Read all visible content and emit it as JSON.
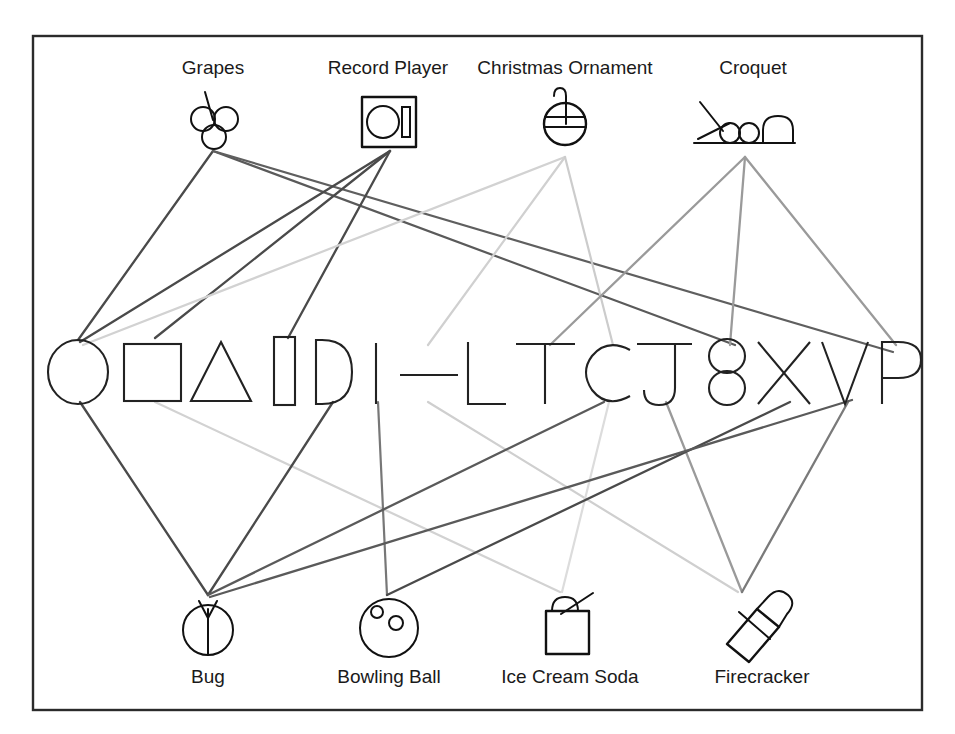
{
  "figure": {
    "title": "",
    "frame": {
      "x": 33,
      "y": 36,
      "width": 889,
      "height": 674,
      "color": "#2b2b2b"
    }
  },
  "colors": {
    "ink": "#1a1a1a",
    "edge_dark": "#4a4a4a",
    "edge_mid": "#8a8a8a",
    "edge_light": "#cfcfcf",
    "background": "#ffffff"
  },
  "top_nodes": [
    {
      "id": "grapes",
      "label": "Grapes",
      "label_x": 213,
      "label_y": 74,
      "icon": "grapes-icon",
      "icon_cx": 213,
      "icon_cy": 120,
      "anchor_x": 213,
      "anchor_y": 151
    },
    {
      "id": "record_player",
      "label": "Record Player",
      "label_x": 388,
      "label_y": 74,
      "icon": "record-player-icon",
      "icon_cx": 388,
      "icon_cy": 122,
      "anchor_x": 390,
      "anchor_y": 151
    },
    {
      "id": "christmas_ornament",
      "label": "Christmas Ornament",
      "label_x": 565,
      "label_y": 74,
      "icon": "christmas-ornament-icon",
      "icon_cx": 563,
      "icon_cy": 120,
      "anchor_x": 565,
      "anchor_y": 157
    },
    {
      "id": "croquet",
      "label": "Croquet",
      "label_x": 753,
      "label_y": 74,
      "icon": "croquet-icon",
      "icon_cx": 748,
      "icon_cy": 122,
      "anchor_x": 745,
      "anchor_y": 157
    }
  ],
  "bottom_nodes": [
    {
      "id": "bug",
      "label": "Bug",
      "label_x": 208,
      "label_y": 683,
      "icon": "bug-icon",
      "icon_cx": 208,
      "icon_cy": 629,
      "anchor_x": 208,
      "anchor_y": 595
    },
    {
      "id": "bowling_ball",
      "label": "Bowling Ball",
      "label_x": 389,
      "label_y": 683,
      "icon": "bowling-ball-icon",
      "icon_cx": 387,
      "icon_cy": 629,
      "anchor_x": 387,
      "anchor_y": 595
    },
    {
      "id": "ice_cream_soda",
      "label": "Ice Cream Soda",
      "label_x": 570,
      "label_y": 683,
      "icon": "ice-cream-soda-icon",
      "icon_cx": 563,
      "icon_cy": 629,
      "anchor_x": 560,
      "anchor_y": 592
    },
    {
      "id": "firecracker",
      "label": "Firecracker",
      "label_x": 762,
      "label_y": 683,
      "icon": "firecracker-icon",
      "icon_cx": 748,
      "icon_cy": 629,
      "anchor_x": 740,
      "anchor_y": 592
    }
  ],
  "middle_row": {
    "baseline_y": 375,
    "items": [
      {
        "id": "m0",
        "glyph": "circle",
        "name": "circle-shape",
        "cx": 78,
        "cy": 372
      },
      {
        "id": "m1",
        "glyph": "square",
        "name": "square-shape",
        "cx": 152,
        "cy": 372
      },
      {
        "id": "m2",
        "glyph": "triangle",
        "name": "triangle-shape",
        "cx": 221,
        "cy": 372
      },
      {
        "id": "m3",
        "glyph": "bar",
        "name": "vertical-bar-shape",
        "cx": 285,
        "cy": 372
      },
      {
        "id": "m4",
        "glyph": "D",
        "name": "letter-d",
        "cx": 331,
        "cy": 372
      },
      {
        "id": "m5",
        "glyph": "I",
        "name": "letter-i",
        "cx": 376,
        "cy": 372
      },
      {
        "id": "m6",
        "glyph": "dash",
        "name": "dash-glyph",
        "cx": 424,
        "cy": 372
      },
      {
        "id": "m7",
        "glyph": "L",
        "name": "letter-l",
        "cx": 482,
        "cy": 372
      },
      {
        "id": "m8",
        "glyph": "T",
        "name": "letter-t",
        "cx": 545,
        "cy": 372
      },
      {
        "id": "m9",
        "glyph": "C",
        "name": "letter-c",
        "cx": 607,
        "cy": 372
      },
      {
        "id": "m10",
        "glyph": "J",
        "name": "letter-j",
        "cx": 665,
        "cy": 372
      },
      {
        "id": "m11",
        "glyph": "8",
        "name": "digit-eight",
        "cx": 727,
        "cy": 372
      },
      {
        "id": "m12",
        "glyph": "X",
        "name": "letter-x",
        "cx": 784,
        "cy": 372
      },
      {
        "id": "m13",
        "glyph": "V",
        "name": "letter-v",
        "cx": 844,
        "cy": 372
      },
      {
        "id": "m14",
        "glyph": "P",
        "name": "letter-p",
        "cx": 896,
        "cy": 372
      }
    ]
  },
  "edges": [
    {
      "from": "grapes",
      "to": "m0",
      "x1": 213,
      "y1": 151,
      "x2": 78,
      "y2": 340,
      "color": "#4a4a4a",
      "width": 2.3
    },
    {
      "from": "grapes",
      "to": "m11",
      "x1": 213,
      "y1": 151,
      "x2": 735,
      "y2": 345,
      "color": "#5a5a5a",
      "width": 2.2
    },
    {
      "from": "grapes",
      "to": "m14",
      "x1": 213,
      "y1": 151,
      "x2": 893,
      "y2": 352,
      "color": "#5f5f5f",
      "width": 2.2
    },
    {
      "from": "record_player",
      "to": "m0",
      "x1": 390,
      "y1": 151,
      "x2": 80,
      "y2": 342,
      "color": "#4a4a4a",
      "width": 2.3
    },
    {
      "from": "record_player",
      "to": "m1",
      "x1": 390,
      "y1": 151,
      "x2": 155,
      "y2": 338,
      "color": "#4a4a4a",
      "width": 2.3
    },
    {
      "from": "record_player",
      "to": "m3",
      "x1": 390,
      "y1": 151,
      "x2": 288,
      "y2": 338,
      "color": "#4a4a4a",
      "width": 2.3
    },
    {
      "from": "christmas_ornament",
      "to": "m0",
      "x1": 565,
      "y1": 157,
      "x2": 83,
      "y2": 345,
      "color": "#d2d2d2",
      "width": 2.2
    },
    {
      "from": "christmas_ornament",
      "to": "m5",
      "x1": 565,
      "y1": 157,
      "x2": 428,
      "y2": 345,
      "color": "#d0d0d0",
      "width": 2.2
    },
    {
      "from": "christmas_ornament",
      "to": "m9",
      "x1": 565,
      "y1": 157,
      "x2": 613,
      "y2": 345,
      "color": "#cccccc",
      "width": 2.2
    },
    {
      "from": "croquet",
      "to": "m8",
      "x1": 745,
      "y1": 157,
      "x2": 550,
      "y2": 345,
      "color": "#9a9a9a",
      "width": 2.3
    },
    {
      "from": "croquet",
      "to": "m11",
      "x1": 745,
      "y1": 157,
      "x2": 730,
      "y2": 345,
      "color": "#9a9a9a",
      "width": 2.3
    },
    {
      "from": "croquet",
      "to": "m14",
      "x1": 745,
      "y1": 157,
      "x2": 896,
      "y2": 345,
      "color": "#9a9a9a",
      "width": 2.3
    },
    {
      "from": "m0",
      "to": "bug",
      "x1": 80,
      "y1": 402,
      "x2": 208,
      "y2": 595,
      "color": "#4a4a4a",
      "width": 2.3
    },
    {
      "from": "m1",
      "to": "ice_cream_soda",
      "x1": 155,
      "y1": 402,
      "x2": 560,
      "y2": 592,
      "color": "#d2d2d2",
      "width": 2.2
    },
    {
      "from": "m4",
      "to": "bug",
      "x1": 333,
      "y1": 402,
      "x2": 208,
      "y2": 595,
      "color": "#4a4a4a",
      "width": 2.3
    },
    {
      "from": "m5",
      "to": "bowling_ball",
      "x1": 378,
      "y1": 402,
      "x2": 387,
      "y2": 595,
      "color": "#777777",
      "width": 2.2
    },
    {
      "from": "m6",
      "to": "firecracker",
      "x1": 428,
      "y1": 402,
      "x2": 738,
      "y2": 592,
      "color": "#cfcfcf",
      "width": 2.2
    },
    {
      "from": "m9",
      "to": "bug",
      "x1": 604,
      "y1": 402,
      "x2": 208,
      "y2": 595,
      "color": "#5a5a5a",
      "width": 2.3
    },
    {
      "from": "m9",
      "to": "ice_cream_soda",
      "x1": 609,
      "y1": 402,
      "x2": 562,
      "y2": 592,
      "color": "#dcdcdc",
      "width": 2.2
    },
    {
      "from": "m10",
      "to": "firecracker",
      "x1": 666,
      "y1": 402,
      "x2": 742,
      "y2": 592,
      "color": "#9a9a9a",
      "width": 2.3
    },
    {
      "from": "m12",
      "to": "bowling_ball",
      "x1": 790,
      "y1": 402,
      "x2": 387,
      "y2": 595,
      "color": "#4a4a4a",
      "width": 2.3
    },
    {
      "from": "m13",
      "to": "firecracker",
      "x1": 848,
      "y1": 402,
      "x2": 742,
      "y2": 592,
      "color": "#7a7a7a",
      "width": 2.3
    },
    {
      "from": "m13",
      "to": "bug",
      "x1": 852,
      "y1": 400,
      "x2": 210,
      "y2": 597,
      "color": "#5a5a5a",
      "width": 2.3
    }
  ]
}
